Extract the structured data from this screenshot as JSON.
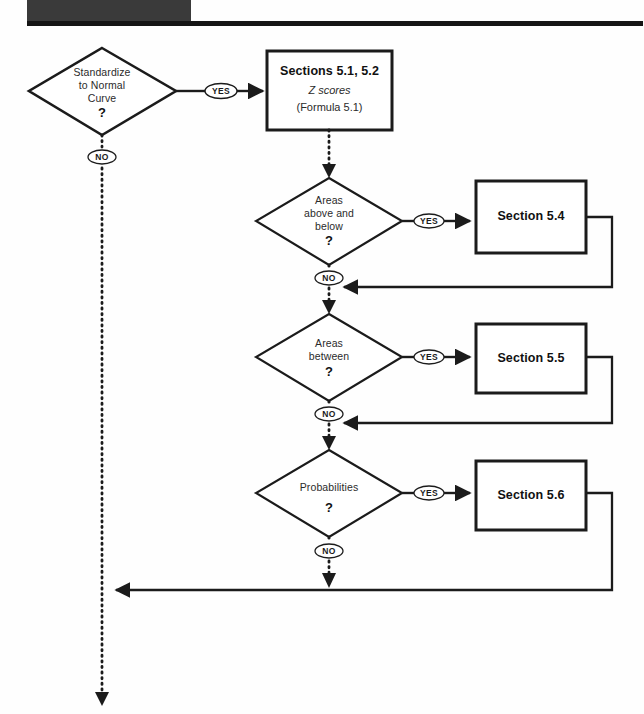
{
  "page": {
    "background_color": "#fefefe",
    "line_color": "#1b1b1b",
    "header_block_color": "#3a3a3a"
  },
  "header": {
    "block_label": "",
    "rule_label": ""
  },
  "flowchart": {
    "type": "decision-flowchart",
    "title": "",
    "decisions": [
      {
        "id": "standardize",
        "label": "Standardize\nto Normal\nCurve",
        "question_mark": "?",
        "yes_label": "YES",
        "no_label": "NO"
      },
      {
        "id": "areas-above-below",
        "label": "Areas\nabove and\nbelow",
        "question_mark": "?",
        "yes_label": "YES",
        "no_label": "NO"
      },
      {
        "id": "areas-between",
        "label": "Areas\nbetween",
        "question_mark": "?",
        "yes_label": "YES",
        "no_label": "NO"
      },
      {
        "id": "probabilities",
        "label": "Probabilities",
        "question_mark": "?",
        "yes_label": "YES",
        "no_label": "NO"
      }
    ],
    "process_boxes": [
      {
        "id": "sections-5-1-5-2",
        "title": "Sections 5.1, 5.2",
        "subtitle_italic": "Z scores",
        "subtitle": "(Formula 5.1)"
      },
      {
        "id": "section-5-4",
        "title": "Section 5.4",
        "subtitle_italic": "",
        "subtitle": ""
      },
      {
        "id": "section-5-5",
        "title": "Section 5.5",
        "subtitle_italic": "",
        "subtitle": ""
      },
      {
        "id": "section-5-6",
        "title": "Section 5.6",
        "subtitle_italic": "",
        "subtitle": ""
      }
    ]
  }
}
